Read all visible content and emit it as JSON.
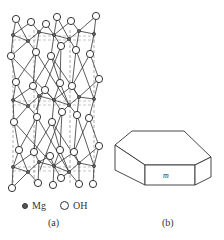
{
  "figure": {
    "panel_a": {
      "caption": "(a)",
      "description": "Brucite Mg(OH)2 layered crystal structure",
      "legend": [
        {
          "symbol": "small-dark-dot",
          "label": "Mg"
        },
        {
          "symbol": "open-circle",
          "label": "OH"
        }
      ]
    },
    "panel_b": {
      "caption": "(b)",
      "description": "Hexagonal platelet crystal habit",
      "face_label": "m"
    }
  },
  "colors": {
    "line": "#333333",
    "background": "#ffffff"
  }
}
